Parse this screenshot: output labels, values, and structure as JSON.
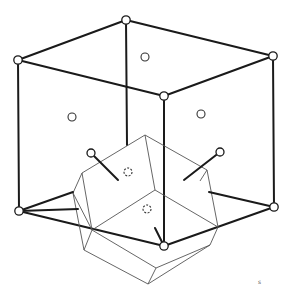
{
  "figure": {
    "colors": {
      "lines": "#1a1a1a",
      "polyhedron": "#555555",
      "background": "#ffffff"
    },
    "cube_vertices": [
      {
        "id": "back-top",
        "x": 126,
        "y": 20
      },
      {
        "id": "left-top",
        "x": 18,
        "y": 60
      },
      {
        "id": "right-top",
        "x": 273,
        "y": 56
      },
      {
        "id": "front-top",
        "x": 164,
        "y": 96
      },
      {
        "id": "left-bottom",
        "x": 19,
        "y": 211
      },
      {
        "id": "right-bottom",
        "x": 274,
        "y": 207
      },
      {
        "id": "front-bottom",
        "x": 164,
        "y": 246
      }
    ],
    "face_atoms": [
      {
        "x": 145,
        "y": 57
      },
      {
        "x": 72,
        "y": 117
      },
      {
        "x": 201,
        "y": 114
      }
    ],
    "hidden_atoms": [
      {
        "x": 128,
        "y": 172
      },
      {
        "x": 147,
        "y": 209
      }
    ],
    "bond_atoms": [
      {
        "x": 91,
        "y": 153
      },
      {
        "x": 220,
        "y": 152
      }
    ],
    "corner_mark": "s"
  }
}
